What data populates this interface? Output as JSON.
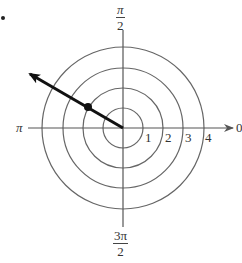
{
  "diagram": {
    "type": "polar-coordinate-plot",
    "center": {
      "x": 123,
      "y": 128
    },
    "ring_spacing_px": 20,
    "rings": [
      1,
      2,
      3,
      4
    ],
    "ring_labels": [
      "1",
      "2",
      "3",
      "4"
    ],
    "angle_labels": {
      "right": "0",
      "top": {
        "numerator": "π",
        "denominator": "2"
      },
      "left": "π",
      "bottom": {
        "numerator": "3π",
        "denominator": "2"
      }
    },
    "ray": {
      "angle_description": "about 5π/6 direction (upper-left)",
      "tip": {
        "x": 28,
        "y": 73
      },
      "point": {
        "x": 88,
        "y": 107,
        "r": 2,
        "label": ""
      }
    },
    "colors": {
      "stroke": "#555555",
      "ray": "#111111",
      "background": "#ffffff"
    }
  },
  "bullet_marker": "•"
}
